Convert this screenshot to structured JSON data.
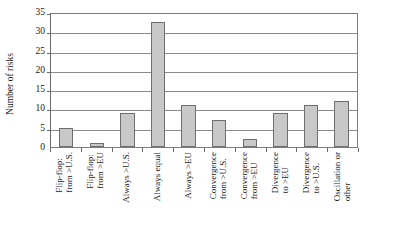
{
  "chart_data": {
    "type": "bar",
    "title": "",
    "xlabel": "",
    "ylabel": "Number of risks",
    "ylim": [
      0,
      35
    ],
    "ytick_step": 5,
    "yticks": [
      0,
      5,
      10,
      15,
      20,
      25,
      30,
      35
    ],
    "grid": true,
    "legend": "none",
    "bar_color": "#c8c8c8",
    "bar_edge_color": "#6e6e6e",
    "categories": [
      "Flip-flop: from >U.S.",
      "Flip-flop: from >EU",
      "Always >U.S.",
      "Always equal",
      "Always >EU",
      "Convergence from >U.S.",
      "Convergence from >EU",
      "Divergence to >EU",
      "Divergence to >U.S.",
      "Oscillation or other"
    ],
    "category_lines": [
      [
        "Flip-flop:",
        "from >U.S."
      ],
      [
        "Flip-flop:",
        "from >EU"
      ],
      [
        "Always >U.S.",
        ""
      ],
      [
        "Always equal",
        ""
      ],
      [
        "Always >EU",
        ""
      ],
      [
        "Convergence",
        "from >U.S."
      ],
      [
        "Convergence",
        "from >EU"
      ],
      [
        "Divergence",
        "to >EU"
      ],
      [
        "Divergence",
        "to >U.S."
      ],
      [
        "Oscillation or",
        "other"
      ]
    ],
    "values": [
      5,
      1,
      9,
      33,
      11,
      7,
      2,
      9,
      11,
      12
    ]
  }
}
